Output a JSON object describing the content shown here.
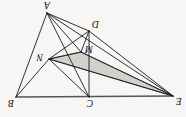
{
  "figure": {
    "orientation_degrees": 180,
    "background_color": "#f7f6f4",
    "line_color": "#1a1a1a",
    "shade_color": "#c9c9c4",
    "vertices": [
      {
        "id": "E",
        "label": "E",
        "x": 13,
        "y": 21
      },
      {
        "id": "C",
        "label": "C",
        "x": 97,
        "y": 20
      },
      {
        "id": "B",
        "label": "B",
        "x": 170,
        "y": 20
      },
      {
        "id": "N",
        "label": "N",
        "x": 137,
        "y": 58
      },
      {
        "id": "M",
        "label": "M",
        "x": 105,
        "y": 65
      },
      {
        "id": "D",
        "label": "D",
        "x": 97,
        "y": 86
      },
      {
        "id": "A",
        "label": "A",
        "x": 139,
        "y": 104
      }
    ],
    "label_positions": [
      {
        "id": "E",
        "label": "E",
        "x": 10,
        "y": 19
      },
      {
        "id": "C",
        "label": "C",
        "x": 96,
        "y": 17
      },
      {
        "id": "B",
        "label": "B",
        "x": 169,
        "y": 17
      },
      {
        "id": "N",
        "label": "N",
        "x": 142,
        "y": 62
      },
      {
        "id": "M",
        "label": "M",
        "x": 101,
        "y": 70
      },
      {
        "id": "D",
        "label": "D",
        "x": 94,
        "y": 95
      },
      {
        "id": "A",
        "label": "A",
        "x": 138,
        "y": 114
      }
    ],
    "edges": [
      {
        "from": "E",
        "to": "B",
        "style": "thick"
      },
      {
        "from": "E",
        "to": "N",
        "style": "thin"
      },
      {
        "from": "E",
        "to": "M",
        "style": "thin"
      },
      {
        "from": "E",
        "to": "D",
        "style": "thin"
      },
      {
        "from": "E",
        "to": "A",
        "style": "thin"
      },
      {
        "from": "C",
        "to": "D",
        "style": "thin"
      },
      {
        "from": "C",
        "to": "N",
        "style": "thin"
      },
      {
        "from": "C",
        "to": "A",
        "style": "thin"
      },
      {
        "from": "B",
        "to": "N",
        "style": "thin"
      },
      {
        "from": "B",
        "to": "A",
        "style": "thin"
      },
      {
        "from": "D",
        "to": "N",
        "style": "thin"
      },
      {
        "from": "D",
        "to": "A",
        "style": "thin"
      },
      {
        "from": "M",
        "to": "N",
        "style": "thin"
      },
      {
        "from": "M",
        "to": "A",
        "style": "thin"
      },
      {
        "from": "M",
        "to": "D",
        "style": "thin"
      }
    ],
    "shaded_faces": [
      {
        "id": "face-EMN",
        "points": "13,21 105,65 137,58"
      }
    ]
  }
}
